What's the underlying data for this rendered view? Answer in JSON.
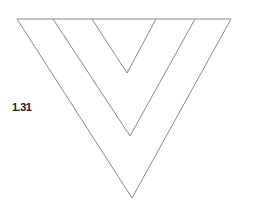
{
  "figure": {
    "label": "1.31",
    "stroke_color": "#8a8a8a",
    "top_line": {
      "x1": 17,
      "y1": 19,
      "x2": 231,
      "y2": 19
    },
    "chevrons": [
      {
        "name": "outer",
        "left": [
          17,
          19
        ],
        "apex": [
          132,
          198
        ],
        "right": [
          231,
          19
        ]
      },
      {
        "name": "middle",
        "left": [
          53,
          19
        ],
        "apex": [
          130,
          136
        ],
        "right": [
          195,
          19
        ]
      },
      {
        "name": "inner",
        "left": [
          92,
          19
        ],
        "apex": [
          127,
          73
        ],
        "right": [
          156,
          19
        ]
      }
    ]
  }
}
